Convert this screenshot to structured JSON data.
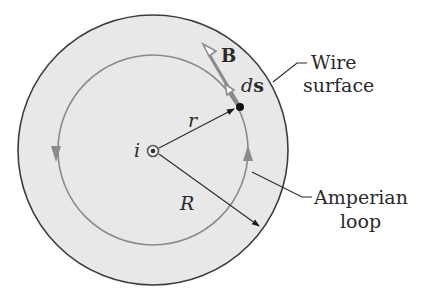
{
  "diagram": {
    "colors": {
      "wire_fill": "#e8e8e8",
      "wire_outline": "#3c3c3c",
      "loop_stroke": "#8a8a8a",
      "vector_gray": "#8c8c8c",
      "line_dark": "#2a2a2a",
      "background": "#ffffff"
    },
    "labels": {
      "current": "i",
      "field_vector": "B",
      "length_element_d": "d",
      "length_element_s": "s",
      "radius_loop": "r",
      "radius_wire": "R",
      "wire_surface_line1": "Wire",
      "wire_surface_line2": "surface",
      "amperian_line1": "Amperian",
      "amperian_line2": "loop"
    },
    "geometry": {
      "center": [
        153,
        151
      ],
      "wire_radius_px": 135,
      "loop_radius_px": 95,
      "loop_direction": "counterclockwise",
      "current_direction": "out of page"
    }
  }
}
